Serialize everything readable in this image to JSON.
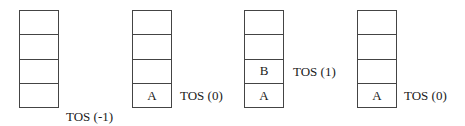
{
  "diagram": {
    "type": "stack-sequence",
    "stacks": [
      {
        "cells_top_to_bottom": [
          "",
          "",
          "",
          ""
        ],
        "tos_label": "TOS (-1)"
      },
      {
        "cells_top_to_bottom": [
          "",
          "",
          "",
          "A"
        ],
        "tos_label": "TOS (0)"
      },
      {
        "cells_top_to_bottom": [
          "",
          "",
          "B",
          "A"
        ],
        "tos_label": "TOS (1)"
      },
      {
        "cells_top_to_bottom": [
          "",
          "",
          "",
          "A"
        ],
        "tos_label": "TOS (0)"
      }
    ]
  }
}
